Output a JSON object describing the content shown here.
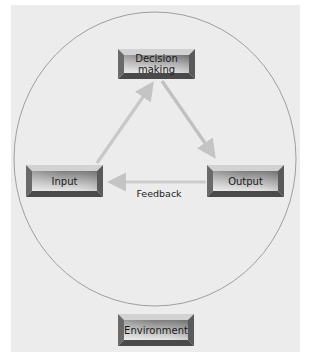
{
  "diagram": {
    "nodes": {
      "decision": {
        "label_line1": "Decision",
        "label_line2": "making"
      },
      "input": {
        "label": "Input"
      },
      "output": {
        "label": "Output"
      },
      "environment": {
        "label": "Environment"
      }
    },
    "edges": [
      {
        "from": "Input",
        "to": "Decision making",
        "label": ""
      },
      {
        "from": "Decision making",
        "to": "Output",
        "label": ""
      },
      {
        "from": "Output",
        "to": "Input",
        "label": "Feedback"
      }
    ],
    "feedback_label": "Feedback",
    "colors": {
      "background": "#ececec",
      "circle_stroke": "#8a8a8a",
      "arrow": "#c8c8c8",
      "box_face": "#9a9a9a",
      "box_bevel_light": "#d8d8d8",
      "box_bevel_dark": "#5a5a5a"
    }
  }
}
